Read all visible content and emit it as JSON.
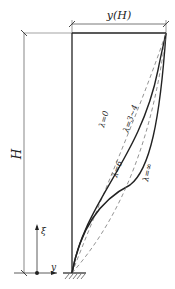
{
  "diagram": {
    "title_label": "y(H)",
    "height_label": "H",
    "axis_vertical_label": "ξ",
    "axis_horizontal_label": "y",
    "colors": {
      "line": "#222222",
      "dashed": "#777777",
      "thin": "#555555"
    },
    "curves": [
      {
        "name": "lambda-0",
        "label": "λ=0",
        "style": "dashed"
      },
      {
        "name": "lambda-3-4",
        "label": "λ=3~4",
        "style": "solid"
      },
      {
        "name": "lambda-6",
        "label": "λ=6",
        "style": "solid"
      },
      {
        "name": "lambda-inf",
        "label": "λ=∞",
        "style": "dashed"
      }
    ]
  }
}
